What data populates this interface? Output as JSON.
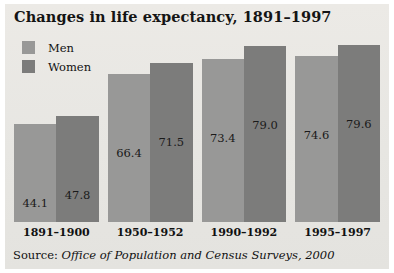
{
  "chart_data": {
    "type": "bar",
    "title": "Changes in life expectancy, 1891–1997",
    "xlabel": "",
    "ylabel": "",
    "ylim": [
      0,
      88
    ],
    "grid": false,
    "legend_position": "top-left",
    "categories": [
      "1891–1900",
      "1950–1952",
      "1990–1992",
      "1995–1997"
    ],
    "series": [
      {
        "name": "Men",
        "color": "#989897",
        "values": [
          44.1,
          66.4,
          73.4,
          74.6
        ]
      },
      {
        "name": "Women",
        "color": "#7c7c7b",
        "values": [
          47.8,
          71.5,
          79.0,
          79.6
        ]
      }
    ],
    "value_labels": [
      [
        "44.1",
        "47.8"
      ],
      [
        "66.4",
        "71.5"
      ],
      [
        "73.4",
        "79.0"
      ],
      [
        "74.6",
        "79.6"
      ]
    ],
    "annotations": {
      "source_prefix": "Source: ",
      "source_text": "Office of Population and Census Surveys, 2000"
    }
  },
  "colors": {
    "panel_background": "#e9e8e4",
    "men_bar": "#989897",
    "women_bar": "#7c7c7b",
    "text": "#111111",
    "page_background": "#ffffff"
  }
}
